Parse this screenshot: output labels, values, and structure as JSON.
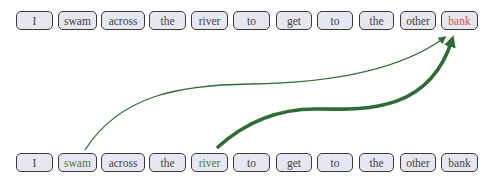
{
  "colors": {
    "box_fill": "#e6e7f0",
    "box_border": "#3a3a3a",
    "text_default": "#444444",
    "text_query": "#d9534f",
    "text_attended": "#4a7a4a",
    "arrow": "#2f6b35"
  },
  "top_row": {
    "tokens": [
      {
        "text": "I",
        "x": 16,
        "w": 37,
        "color": "default"
      },
      {
        "text": "swam",
        "x": 58,
        "w": 39,
        "color": "default"
      },
      {
        "text": "across",
        "x": 101,
        "w": 44,
        "color": "default"
      },
      {
        "text": "the",
        "x": 149,
        "w": 37,
        "color": "default"
      },
      {
        "text": "river",
        "x": 191,
        "w": 37,
        "color": "default"
      },
      {
        "text": "to",
        "x": 233,
        "w": 37,
        "color": "default"
      },
      {
        "text": "get",
        "x": 276,
        "w": 36,
        "color": "default"
      },
      {
        "text": "to",
        "x": 317,
        "w": 36,
        "color": "default"
      },
      {
        "text": "the",
        "x": 359,
        "w": 35,
        "color": "default"
      },
      {
        "text": "other",
        "x": 400,
        "w": 36,
        "color": "default"
      },
      {
        "text": "bank",
        "x": 441,
        "w": 37,
        "color": "query"
      }
    ]
  },
  "bottom_row": {
    "tokens": [
      {
        "text": "I",
        "x": 16,
        "w": 37,
        "color": "default"
      },
      {
        "text": "swam",
        "x": 58,
        "w": 39,
        "color": "attended"
      },
      {
        "text": "across",
        "x": 101,
        "w": 44,
        "color": "default"
      },
      {
        "text": "the",
        "x": 149,
        "w": 37,
        "color": "default"
      },
      {
        "text": "river",
        "x": 191,
        "w": 37,
        "color": "attended"
      },
      {
        "text": "to",
        "x": 233,
        "w": 37,
        "color": "default"
      },
      {
        "text": "get",
        "x": 276,
        "w": 36,
        "color": "default"
      },
      {
        "text": "to",
        "x": 317,
        "w": 36,
        "color": "default"
      },
      {
        "text": "the",
        "x": 359,
        "w": 35,
        "color": "default"
      },
      {
        "text": "other",
        "x": 400,
        "w": 36,
        "color": "default"
      },
      {
        "text": "bank",
        "x": 441,
        "w": 37,
        "color": "default"
      }
    ]
  },
  "arrows": [
    {
      "from": "swam",
      "to": "bank",
      "weight": "thin"
    },
    {
      "from": "river",
      "to": "bank",
      "weight": "thick"
    }
  ]
}
